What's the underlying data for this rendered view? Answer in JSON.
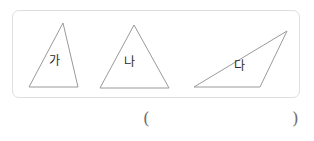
{
  "page": {
    "background_color": "#ffffff",
    "width": 314,
    "height": 141
  },
  "figure_panel": {
    "border_color": "#dedede",
    "background_color": "#ffffff",
    "stroke_color": "#9a9a9a",
    "shapes": [
      {
        "id": "triangle-ga",
        "label": "가",
        "kind": "triangle",
        "description": "scalene triangle, apex right of center",
        "points": "63,23 29,87 78,87"
      },
      {
        "id": "triangle-na",
        "label": "나",
        "kind": "triangle",
        "description": "isosceles triangle, apex centered",
        "points": "134,25 100,88 169,88"
      },
      {
        "id": "triangle-da",
        "label": "다",
        "kind": "triangle",
        "description": "obtuse scalene triangle, apex upper right",
        "points": "287,31 194,87 260,87"
      }
    ]
  },
  "answer_row": {
    "open_paren": "(",
    "close_paren": ")",
    "answer_value": ""
  }
}
